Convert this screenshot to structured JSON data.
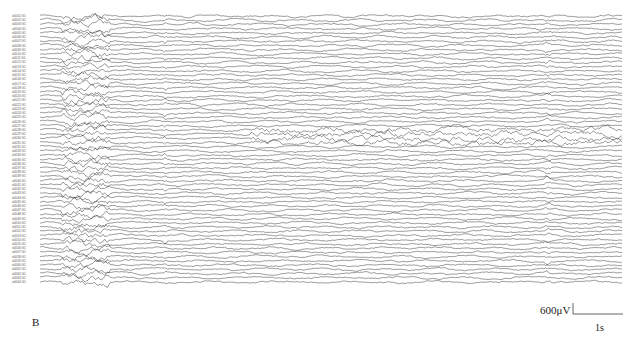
{
  "chart_data": {
    "type": "line",
    "title": "",
    "panel_label": "B",
    "xlabel": "time",
    "ylabel": "channel",
    "channel_count": 64,
    "channel_labels": [
      "s0001 G1",
      "s0002 G1",
      "s0003 G1",
      "s0004 G1",
      "s0005 G1",
      "s0006 G1",
      "s0007 G1",
      "s0008 G1",
      "s0009 G1",
      "s0010 G1",
      "s0011 G1",
      "s0012 G1",
      "s0013 G1",
      "s0014 G1",
      "s0015 G1",
      "s0016 G1",
      "s0017 G1",
      "s0018 G1",
      "s0019 G1",
      "s0020 G1",
      "s0021 G1",
      "s0022 G1",
      "s0023 G1",
      "s0024 G1",
      "s0025 G1",
      "s0026 G1",
      "s0027 G1",
      "s0028 G1",
      "s0029 G1",
      "s0030 G1",
      "s0031 G1",
      "s0032 G1",
      "s0033 G1",
      "s0034 G1",
      "s0035 G1",
      "s0036 G1",
      "s0037 G1",
      "s0038 G1",
      "s0039 G1",
      "s0040 G1",
      "s0041 G1",
      "s0042 G1",
      "s0043 G1",
      "s0044 G1",
      "s0045 G1",
      "s0046 G1",
      "s0047 G1",
      "s0048 G1",
      "s0049 G1",
      "s0050 G1",
      "s0051 G1",
      "s0052 G1",
      "s0053 G1",
      "s0054 G1",
      "s0055 G1",
      "s0056 G1",
      "s0057 G1",
      "s0058 G1",
      "s0059 G1",
      "s0060 G1",
      "s0061 G1",
      "s0062 G1",
      "s0063 G1",
      "s0064 G1"
    ],
    "scale_bar": {
      "amplitude": "600μV",
      "time": "1s",
      "time_px": 50
    },
    "annotations": [
      {
        "label": "early high-amplitude burst",
        "x_range_px": [
          62,
          110
        ],
        "channels": "most"
      },
      {
        "label": "rhythmic spiking",
        "x_range_px": [
          250,
          622
        ],
        "channels": [
          27,
          30
        ]
      },
      {
        "label": "transition bands",
        "x_px": [
          165,
          548
        ]
      }
    ],
    "plot_area_px": {
      "x0": 40,
      "x1": 622,
      "y0": 16,
      "y1": 282
    }
  },
  "labels": {
    "panel": "B",
    "amp": "600μV",
    "time": "1s"
  }
}
